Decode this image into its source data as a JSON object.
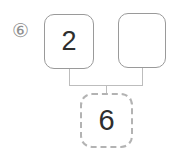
{
  "exercise": {
    "number_label": "⑥",
    "top_left_value": "2",
    "top_right_value": "",
    "bottom_value": "6"
  },
  "colors": {
    "box_border": "#9a9a9a",
    "dashed_box_border": "#b3b3b3",
    "connector_line": "#bdbdbd",
    "digit_text": "#2e2e2e",
    "exercise_number": "#8f8f8f",
    "background": "#ffffff"
  }
}
